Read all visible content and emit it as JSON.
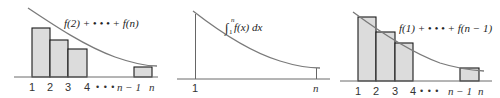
{
  "panels": [
    {
      "id": "left",
      "label": "f(2) + • • • + f(n)",
      "ticks": [
        "1",
        "2",
        "3",
        "4",
        "• • •",
        "n − 1",
        "n"
      ],
      "description": "Right-endpoint rectangles lying below the curve"
    },
    {
      "id": "center",
      "label": "∫₁ⁿ f(x) dx",
      "label_parts": {
        "integral": "∫",
        "lower": "1",
        "upper": "n",
        "body": "f(x) dx"
      },
      "ticks": [
        "1",
        "n"
      ],
      "description": "Area under curve from 1 to n"
    },
    {
      "id": "right",
      "label": "f(1) + • • • + f(n − 1)",
      "ticks": [
        "1",
        "2",
        "3",
        "4",
        "• • •",
        "n − 1",
        "n"
      ],
      "description": "Left-endpoint rectangles lying above the curve"
    }
  ],
  "colors": {
    "bar_fill": "#dcdcdc",
    "bar_stroke": "#1a1a1a",
    "curve": "#7a7a7a",
    "axis": "#6a6a6a"
  }
}
